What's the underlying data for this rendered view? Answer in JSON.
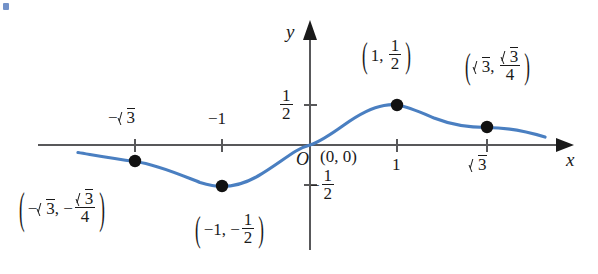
{
  "figure": {
    "type": "math-graph",
    "function": "y = x / (1 + x^2)",
    "axes": {
      "x_axis_label": "x",
      "y_axis_label": "y",
      "origin_label": "O"
    },
    "x_ticks": [
      {
        "value": -1.7320508,
        "label_parts": {
          "sign": "−",
          "radicand": "3"
        },
        "display": "−√3",
        "position": "above"
      },
      {
        "value": -1,
        "display": "−1",
        "position": "above"
      },
      {
        "value": 1,
        "display": "1",
        "position": "below"
      },
      {
        "value": 1.7320508,
        "label_parts": {
          "sign": "",
          "radicand": "3"
        },
        "display": "√3",
        "position": "below"
      }
    ],
    "y_ticks": [
      {
        "value": 0.5,
        "numerator": "1",
        "denominator": "2",
        "sign": "",
        "display": "1/2"
      },
      {
        "value": -0.5,
        "numerator": "1",
        "denominator": "2",
        "sign": "−",
        "display": "−1/2"
      }
    ],
    "points": [
      {
        "name": "local-minimum",
        "x": -1,
        "y": -0.5,
        "label": "(−1, −1/2)",
        "parts": {
          "x_text": "−1",
          "y_sign": "−",
          "y_num": "1",
          "y_den": "2"
        }
      },
      {
        "name": "inflection-left",
        "x": -1.7320508,
        "y": -0.4330127,
        "label": "(−√3, −√3/4)",
        "parts": {
          "x_sign": "−",
          "x_radicand": "3",
          "y_sign": "−",
          "y_num_radicand": "3",
          "y_den": "4"
        }
      },
      {
        "name": "origin-point",
        "x": 0,
        "y": 0,
        "label": "(0, 0)"
      },
      {
        "name": "local-maximum",
        "x": 1,
        "y": 0.5,
        "label": "(1, 1/2)",
        "parts": {
          "x_text": "1",
          "y_num": "1",
          "y_den": "2"
        }
      },
      {
        "name": "inflection-right",
        "x": 1.7320508,
        "y": 0.4330127,
        "label": "(√3, √3/4)",
        "parts": {
          "x_radicand": "3",
          "y_num_radicand": "3",
          "y_den": "4"
        }
      }
    ],
    "colors": {
      "curve": "#4a7fc1",
      "axis": "#58585a",
      "point": "#111111",
      "text": "#1a1a1a"
    },
    "curve": {
      "x_domain": [
        -3.13,
        2.7
      ],
      "description": "S-shaped odd rational function rising from left tail below axis, minimum at x=-1, through origin, maximum at x=1, decaying toward right"
    }
  }
}
